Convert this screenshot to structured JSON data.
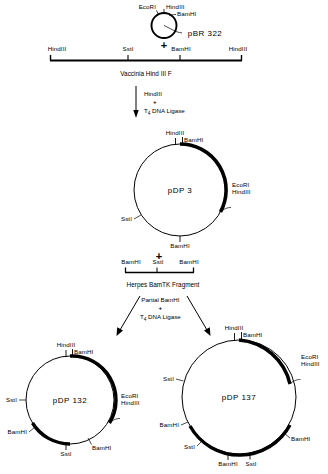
{
  "figure": {
    "ink": "#000000",
    "background": "#ffffff"
  },
  "pbr322": {
    "name": "pBR 322",
    "sites": [
      {
        "label": "EcoRI"
      },
      {
        "label": "HindIII"
      },
      {
        "label": "BamHI"
      }
    ]
  },
  "plus_symbols": {
    "one": "+",
    "two": "+",
    "three": "+",
    "four": "+"
  },
  "vaccinia": {
    "caption": "Vaccinia  Hind III F",
    "sites": [
      {
        "label": "HindIII"
      },
      {
        "label": "SstI"
      },
      {
        "label": "BamHI"
      },
      {
        "label": "HindIII"
      }
    ]
  },
  "step1": {
    "line1": "HindIII",
    "plus": "+",
    "line3_prefix": "T",
    "line3_sub": "4",
    "line3_rest": " DNA  Ligase"
  },
  "pdp3": {
    "name": "pDP 3",
    "sites": [
      {
        "label": "HindIII"
      },
      {
        "label": "BamHI"
      },
      {
        "label": "EcoRI"
      },
      {
        "label": "HindIII"
      },
      {
        "label": "SstI"
      },
      {
        "label": "BamHI"
      }
    ]
  },
  "herpes": {
    "caption": "Herpes  BamTK  Fragment",
    "sites": [
      {
        "label": "BamHI"
      },
      {
        "label": "SstI"
      },
      {
        "label": "BamHI"
      }
    ]
  },
  "step2": {
    "line1": "Partial  BamHI",
    "plus": "+",
    "line3_prefix": "T",
    "line3_sub": "4",
    "line3_rest": " DNA  Ligase"
  },
  "pdp132": {
    "name": "pDP 132",
    "sites": [
      {
        "label": "HindIII"
      },
      {
        "label": "BamHI"
      },
      {
        "label": "EcoRI"
      },
      {
        "label": "HindIII"
      },
      {
        "label": "SstI"
      },
      {
        "label": "BamHI"
      },
      {
        "label": "SstI"
      },
      {
        "label": "BamHI"
      }
    ]
  },
  "pdp137": {
    "name": "pDP 137",
    "sites": [
      {
        "label": "HindIII"
      },
      {
        "label": "BamHI"
      },
      {
        "label": "EcoRI"
      },
      {
        "label": "HindIII"
      },
      {
        "label": "SstI"
      },
      {
        "label": "BamHI"
      },
      {
        "label": "SstI"
      },
      {
        "label": "BamHI"
      },
      {
        "label": "SstI"
      },
      {
        "label": "BamHI"
      }
    ]
  }
}
